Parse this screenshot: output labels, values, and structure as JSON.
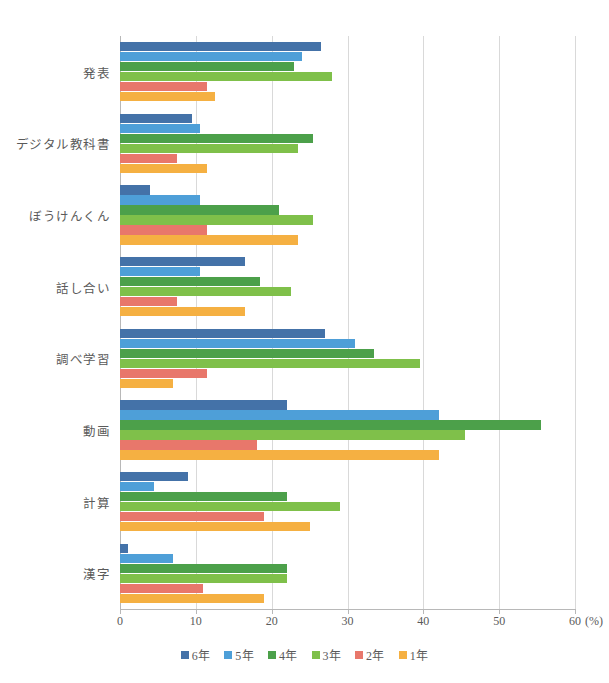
{
  "chart_data": {
    "type": "bar",
    "orientation": "horizontal",
    "title": "",
    "subtitle": "",
    "xlabel": "(%)",
    "ylabel": "",
    "xlim": [
      0,
      60
    ],
    "xticks": [
      0,
      10,
      20,
      30,
      40,
      50,
      60
    ],
    "xtick_labels": [
      "0",
      "10",
      "20",
      "30",
      "40",
      "50",
      "60"
    ],
    "unit": "(%)",
    "grid": "vertical",
    "legend_position": "bottom",
    "categories": [
      "発表",
      "デジタル教科書",
      "ぼうけんくん",
      "話し合い",
      "調べ学習",
      "動画",
      "計算",
      "漢字"
    ],
    "series": [
      {
        "name": "6年",
        "color": "#4472a8",
        "values": [
          26.5,
          9.5,
          4.0,
          16.5,
          27.0,
          22.0,
          9.0,
          1.0
        ]
      },
      {
        "name": "5年",
        "color": "#4e9fd8",
        "values": [
          24.0,
          10.5,
          10.5,
          10.5,
          31.0,
          42.0,
          4.5,
          7.0
        ]
      },
      {
        "name": "4年",
        "color": "#4ca04a",
        "values": [
          23.0,
          25.5,
          21.0,
          18.5,
          33.5,
          55.5,
          22.0,
          22.0
        ]
      },
      {
        "name": "3年",
        "color": "#7fc04a",
        "values": [
          28.0,
          23.5,
          25.5,
          22.5,
          39.5,
          45.5,
          29.0,
          22.0
        ]
      },
      {
        "name": "2年",
        "color": "#e8776b",
        "values": [
          11.5,
          7.5,
          11.5,
          7.5,
          11.5,
          18.0,
          19.0,
          11.0
        ]
      },
      {
        "name": "1年",
        "color": "#f5b042",
        "values": [
          12.5,
          11.5,
          23.5,
          16.5,
          7.0,
          42.0,
          25.0,
          19.0
        ]
      }
    ]
  },
  "axis": {
    "unit_label": "(%)"
  }
}
